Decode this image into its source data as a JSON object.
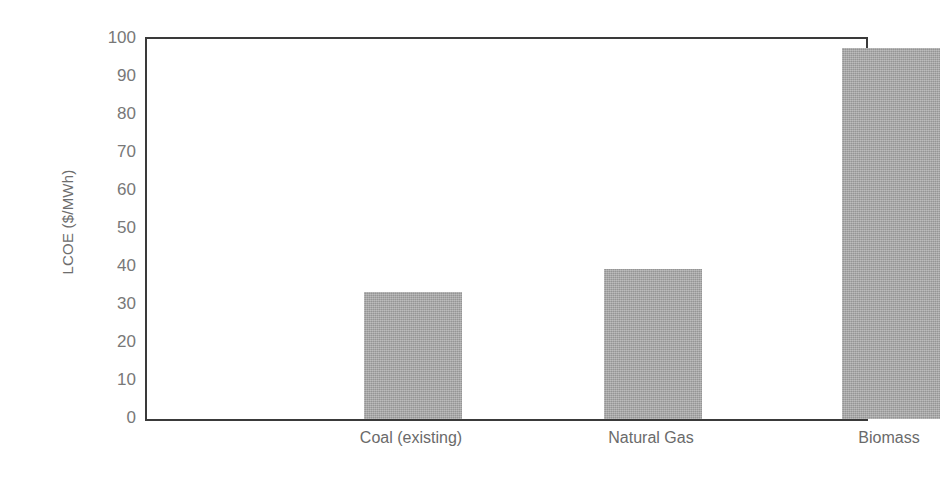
{
  "chart_data": {
    "type": "bar",
    "title": "",
    "subtitle": "",
    "xlabel": "",
    "ylabel": "LCOE ($/MWh)",
    "categories": [
      "Coal (existing)",
      "Natural Gas",
      "Biomass"
    ],
    "values": [
      33.5,
      39.5,
      97.5
    ],
    "series": [
      {
        "name": "LCOE",
        "values": [
          33.5,
          39.5,
          97.5
        ],
        "color": "#a3a3a3"
      }
    ],
    "ylim": [
      0,
      100
    ],
    "ytick_step": 10,
    "yticks": [
      0,
      10,
      20,
      30,
      40,
      50,
      60,
      70,
      80,
      90,
      100
    ],
    "ytick_labels": [
      "0",
      "10",
      "20",
      "30",
      "40",
      "50",
      "60",
      "70",
      "80",
      "90",
      "100"
    ],
    "grid": false,
    "legend": false,
    "legend_position": "none",
    "annotations": [],
    "bar_color": "#a3a3a3",
    "axis_color": "#3a3a3a",
    "tick_label_color": "#787878",
    "axis_label_color": "#6d6d6d",
    "background_color": "#ffffff",
    "bar_width_px": 98,
    "bar_centers_px": [
      266,
      506,
      744
    ]
  }
}
